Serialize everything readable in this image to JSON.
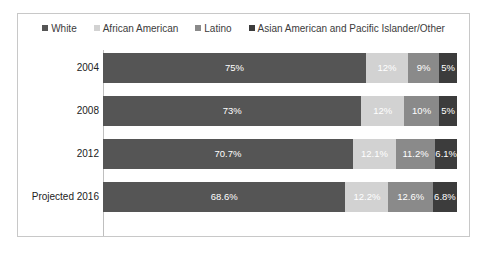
{
  "chart_data": {
    "type": "bar",
    "orientation": "horizontal",
    "stacked": true,
    "normalized_percent": true,
    "title": "",
    "xlabel": "",
    "ylabel": "",
    "grid": false,
    "legend_position": "top",
    "xlim": [
      0,
      100
    ],
    "categories": [
      "2004",
      "2008",
      "2012",
      "Projected 2016"
    ],
    "series": [
      {
        "name": "White",
        "color": "#555555",
        "values": [
          75,
          73,
          70.7,
          68.6
        ],
        "labels": [
          "75%",
          "73%",
          "70.7%",
          "68.6%"
        ]
      },
      {
        "name": "African American",
        "color": "#d2d2d2",
        "values": [
          12,
          12,
          12.1,
          12.2
        ],
        "labels": [
          "12%",
          "12%",
          "12.1%",
          "12.2%"
        ]
      },
      {
        "name": "Latino",
        "color": "#8a8a8a",
        "values": [
          9,
          10,
          11.2,
          12.6
        ],
        "labels": [
          "9%",
          "10%",
          "11.2%",
          "12.6%"
        ]
      },
      {
        "name": "Asian American and Pacific Islander/Other",
        "color": "#3c3c3c",
        "values": [
          5,
          5,
          6.1,
          6.8
        ],
        "labels": [
          "5%",
          "5%",
          "6.1%",
          "6.8%"
        ]
      }
    ]
  },
  "legend": {
    "items": [
      {
        "label": "White",
        "color": "#555555",
        "marker": "square-marker"
      },
      {
        "label": "African American",
        "color": "#d2d2d2",
        "marker": "square-marker"
      },
      {
        "label": "Latino",
        "color": "#8a8a8a",
        "marker": "square-marker"
      },
      {
        "label": "Asian American and Pacific Islander/Other",
        "color": "#3c3c3c",
        "marker": "square-marker"
      }
    ]
  },
  "rows": [
    {
      "label": "2004",
      "segments": [
        {
          "series": "White",
          "label": "75%",
          "value": 75,
          "color": "#555555"
        },
        {
          "series": "African American",
          "label": "12%",
          "value": 12,
          "color": "#d2d2d2"
        },
        {
          "series": "Latino",
          "label": "9%",
          "value": 9,
          "color": "#8a8a8a"
        },
        {
          "series": "Asian American and Pacific Islander/Other",
          "label": "5%",
          "value": 5,
          "color": "#3c3c3c"
        }
      ]
    },
    {
      "label": "2008",
      "segments": [
        {
          "series": "White",
          "label": "73%",
          "value": 73,
          "color": "#555555"
        },
        {
          "series": "African American",
          "label": "12%",
          "value": 12,
          "color": "#d2d2d2"
        },
        {
          "series": "Latino",
          "label": "10%",
          "value": 10,
          "color": "#8a8a8a"
        },
        {
          "series": "Asian American and Pacific Islander/Other",
          "label": "5%",
          "value": 5,
          "color": "#3c3c3c"
        }
      ]
    },
    {
      "label": "2012",
      "segments": [
        {
          "series": "White",
          "label": "70.7%",
          "value": 70.7,
          "color": "#555555"
        },
        {
          "series": "African American",
          "label": "12.1%",
          "value": 12.1,
          "color": "#d2d2d2"
        },
        {
          "series": "Latino",
          "label": "11.2%",
          "value": 11.2,
          "color": "#8a8a8a"
        },
        {
          "series": "Asian American and Pacific Islander/Other",
          "label": "6.1%",
          "value": 6.1,
          "color": "#3c3c3c"
        }
      ]
    },
    {
      "label": "Projected 2016",
      "segments": [
        {
          "series": "White",
          "label": "68.6%",
          "value": 68.6,
          "color": "#555555"
        },
        {
          "series": "African American",
          "label": "12.2%",
          "value": 12.2,
          "color": "#d2d2d2"
        },
        {
          "series": "Latino",
          "label": "12.6%",
          "value": 12.6,
          "color": "#8a8a8a"
        },
        {
          "series": "Asian American and Pacific Islander/Other",
          "label": "6.8%",
          "value": 6.8,
          "color": "#3c3c3c"
        }
      ]
    }
  ],
  "colors": {
    "white_series": "#555555",
    "african_american_series": "#d2d2d2",
    "latino_series": "#8a8a8a",
    "asian_other_series": "#3c3c3c",
    "frame_border": "#c8c8c8",
    "axis_line": "#bfbfbf",
    "background": "#ffffff"
  }
}
